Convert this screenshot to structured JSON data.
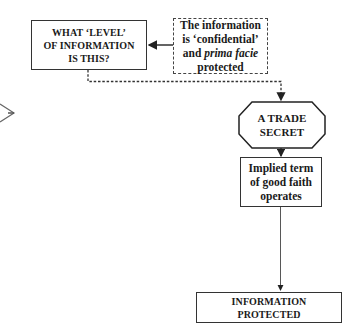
{
  "nodes": {
    "level_question": {
      "lines": [
        "WHAT ‘LEVEL’",
        "OF INFORMATION",
        "IS THIS?"
      ]
    },
    "confidential": {
      "line1": "The information",
      "line2": "is ‘confidential’",
      "line3_pre": "and ",
      "line3_em": "prima facie",
      "line4": "protected"
    },
    "trade_secret": {
      "lines": [
        "A TRADE",
        "SECRET"
      ]
    },
    "implied_term": {
      "lines": [
        "Implied term",
        "of good faith",
        "operates"
      ]
    },
    "protected": {
      "lines": [
        "INFORMATION",
        "PROTECTED"
      ]
    }
  },
  "colors": {
    "stroke": "#333333",
    "text": "#1a1a1a",
    "background": "#ffffff"
  }
}
